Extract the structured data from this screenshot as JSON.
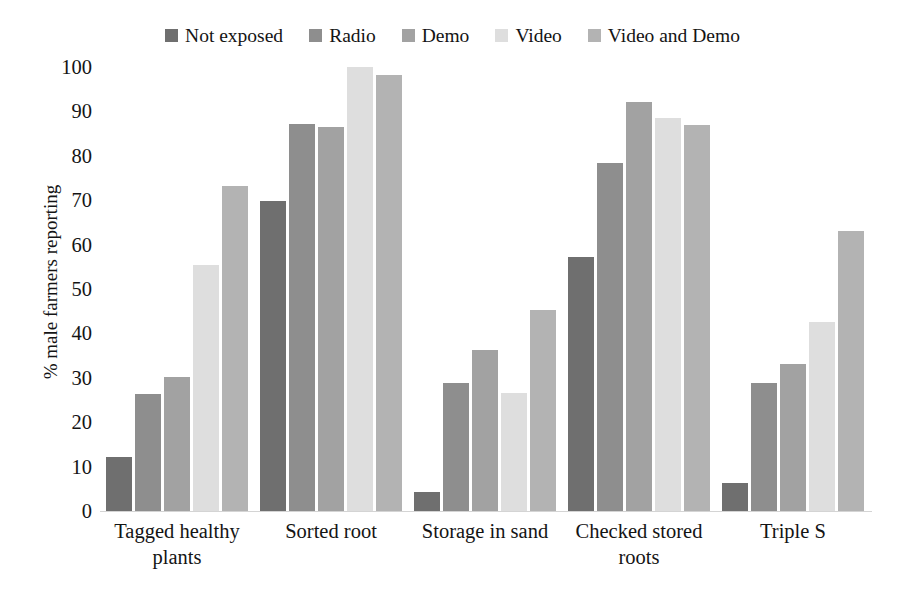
{
  "chart_data": {
    "type": "bar",
    "title": "",
    "xlabel": "",
    "ylabel": "% male farmers reporting",
    "ylim": [
      0,
      100
    ],
    "yticks": [
      0,
      10,
      20,
      30,
      40,
      50,
      60,
      70,
      80,
      90,
      100
    ],
    "ytick_labels": [
      "0",
      "10",
      "20",
      "30",
      "40",
      "50",
      "60",
      "70",
      "80",
      "90",
      "100"
    ],
    "grid": false,
    "legend_position": "top-center",
    "categories": [
      "Tagged healthy plants",
      "Sorted root",
      "Storage in sand",
      "Checked stored roots",
      "Triple S"
    ],
    "category_lines": [
      [
        "Tagged healthy",
        "plants"
      ],
      [
        "Sorted root"
      ],
      [
        "Storage in sand"
      ],
      [
        "Checked stored",
        "roots"
      ],
      [
        "Triple S"
      ]
    ],
    "series": [
      {
        "name": "Not exposed",
        "color": "#6f6f6f",
        "values": [
          12.2,
          69.8,
          4.2,
          57.2,
          6.2
        ]
      },
      {
        "name": "Radio",
        "color": "#8e8e8e",
        "values": [
          26.3,
          87.2,
          28.9,
          78.4,
          28.9
        ]
      },
      {
        "name": "Demo",
        "color": "#a2a2a2",
        "values": [
          30.2,
          86.6,
          36.2,
          92.1,
          33.1
        ]
      },
      {
        "name": "Video",
        "color": "#dedede",
        "values": [
          55.3,
          100.0,
          26.5,
          88.6,
          42.5
        ]
      },
      {
        "name": "Video and Demo",
        "color": "#b3b3b3",
        "values": [
          73.2,
          98.3,
          45.3,
          87.0,
          63.0
        ]
      }
    ]
  },
  "colors": {
    "axis_line": "#d4d4d4",
    "text": "#141414",
    "background": "#ffffff"
  }
}
